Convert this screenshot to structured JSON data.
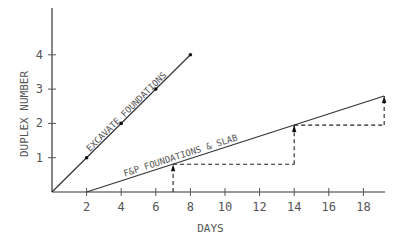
{
  "chart_data": {
    "type": "line",
    "title": "",
    "xlabel": "DAYS",
    "ylabel": "DUPLEX NUMBER",
    "xlim": [
      0,
      19.5
    ],
    "ylim": [
      0,
      5
    ],
    "x_ticks": [
      2,
      4,
      6,
      8,
      10,
      12,
      14,
      16,
      18
    ],
    "y_ticks": [
      1,
      2,
      3,
      4
    ],
    "grid": false,
    "legend": "none (inline line labels)",
    "series": [
      {
        "name": "EXCAVATE FOUNDATIONS",
        "x": [
          0,
          2,
          4,
          6,
          8
        ],
        "y": [
          0,
          1,
          2,
          3,
          4
        ],
        "markers": [
          [
            2,
            1
          ],
          [
            4,
            2
          ],
          [
            6,
            3
          ],
          [
            8,
            4
          ]
        ]
      },
      {
        "name": "F&P FOUNDATIONS & SLAB",
        "x": [
          2,
          19.2
        ],
        "y": [
          0,
          2.8
        ]
      }
    ],
    "annotations": [
      {
        "type": "dashed-step-with-arrows",
        "points": [
          [
            7,
            0
          ],
          [
            7,
            0.81
          ],
          [
            14,
            0.81
          ],
          [
            14,
            1.95
          ],
          [
            19.2,
            1.95
          ],
          [
            19.2,
            2.8
          ]
        ],
        "arrows_up_at_days": [
          7,
          14,
          19.2
        ]
      }
    ]
  }
}
